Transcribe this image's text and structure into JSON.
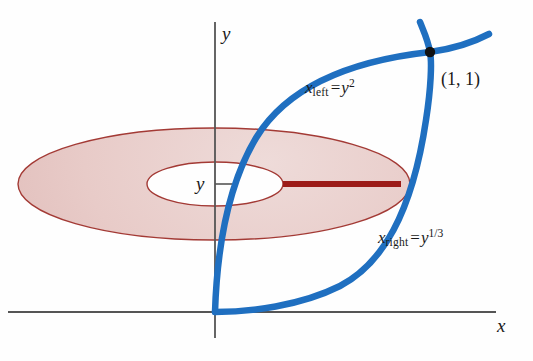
{
  "figure": {
    "kind": "calculus-washer-method-diagram",
    "background_color": "#fefefe",
    "axes": {
      "x_axis_label": "x",
      "y_axis_label": "y",
      "axis_color": "#555555"
    },
    "curves": [
      {
        "name": "left-boundary-curve",
        "label_var": "x",
        "label_sub": "left",
        "label_eq": "=",
        "label_rhs_base": "y",
        "label_rhs_exp": "2",
        "label_plain": "x_left = y^2",
        "color": "#1f6fc0"
      },
      {
        "name": "right-boundary-curve",
        "label_var": "x",
        "label_sub": "right",
        "label_eq": "=",
        "label_rhs_base": "y",
        "label_rhs_exp": "1/3",
        "label_plain": "x_right = y^(1/3)",
        "color": "#1f6fc0"
      }
    ],
    "intersection_point": {
      "label": "(1, 1)",
      "marker_color": "#111111"
    },
    "y_tick": {
      "label": "y"
    },
    "washer": {
      "name": "annulus-washer",
      "fill_color": "#e7c9c6",
      "outline_color": "#a33a35",
      "hole_fill_color": "#ffffff"
    },
    "radius_segment": {
      "name": "washer-radius-segment",
      "color": "#9c1b18"
    }
  }
}
